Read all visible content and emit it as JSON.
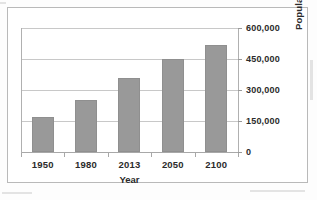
{
  "chart_data": {
    "type": "bar",
    "title": "",
    "categories": [
      "1950",
      "1980",
      "2013",
      "2050",
      "2100"
    ],
    "values": [
      170000,
      250000,
      360000,
      450000,
      520000
    ],
    "series": [
      {
        "name": "Population",
        "values": [
          170000,
          250000,
          360000,
          450000,
          520000
        ]
      }
    ],
    "xlabel": "Year",
    "ylabel": "Population (Thousands)",
    "ylim": [
      0,
      600000
    ],
    "ytick_values": [
      0,
      150000,
      300000,
      450000,
      600000
    ],
    "ytick_labels": [
      "0",
      "150,000",
      "300,000",
      "450,000",
      "600,000"
    ],
    "grid": true,
    "legend": false,
    "bar_color": "#999999",
    "gridline_color": "#c8c8c8",
    "background_color": "#ffffff"
  }
}
